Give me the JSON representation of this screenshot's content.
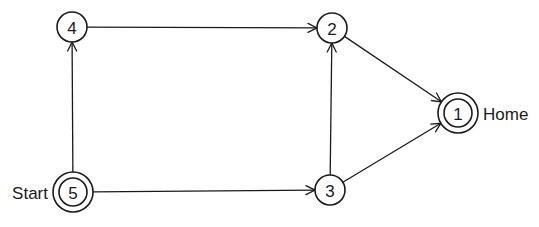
{
  "diagram": {
    "type": "directed-graph",
    "nodes": [
      {
        "id": "1",
        "label": "1",
        "x": 458,
        "y": 113,
        "double": true,
        "side_label": "Home",
        "side": "right"
      },
      {
        "id": "2",
        "label": "2",
        "x": 332,
        "y": 28,
        "double": false
      },
      {
        "id": "3",
        "label": "3",
        "x": 330,
        "y": 190,
        "double": false
      },
      {
        "id": "4",
        "label": "4",
        "x": 72,
        "y": 27,
        "double": false
      },
      {
        "id": "5",
        "label": "5",
        "x": 73,
        "y": 192,
        "double": true,
        "side_label": "Start",
        "side": "left"
      }
    ],
    "edges": [
      {
        "from": "5",
        "to": "4"
      },
      {
        "from": "4",
        "to": "2"
      },
      {
        "from": "2",
        "to": "1"
      },
      {
        "from": "3",
        "to": "2"
      },
      {
        "from": "5",
        "to": "3"
      },
      {
        "from": "3",
        "to": "1"
      }
    ],
    "labels": {
      "start": "Start",
      "home": "Home"
    },
    "colors": {
      "stroke": "#1a1a1a",
      "background": "#ffffff"
    }
  }
}
